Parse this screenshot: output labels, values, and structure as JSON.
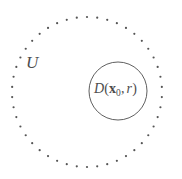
{
  "figure": {
    "name": "open-set-with-disk",
    "background_color": "#ffffff",
    "width": 182,
    "height": 179,
    "stroke_color": "#4d4d4d",
    "dot_color": "#555555"
  },
  "outer_region": {
    "label": "U",
    "label_name": "open-set-label-U",
    "boundary_style": "dotted",
    "center_x": 87,
    "center_y": 92,
    "radius": 75,
    "dot_count": 46,
    "dot_radius": 1.1,
    "label_x": 26,
    "label_y": 54
  },
  "inner_disk": {
    "label_parts": {
      "d": "D",
      "open_paren": "(",
      "x": "x",
      "subscript": "0",
      "comma": ",",
      "r": "r",
      "close_paren": ")"
    },
    "label_plain": "D(x0, r)",
    "boundary_style": "solid",
    "center_x": 118,
    "center_y": 91,
    "radius": 29,
    "stroke_width": 0.9,
    "label_x": 94,
    "label_y": 82
  }
}
